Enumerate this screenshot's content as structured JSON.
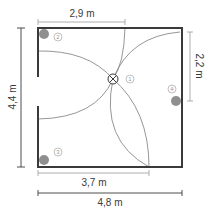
{
  "diagram": {
    "type": "floor-plan",
    "colors": {
      "wall": "#3a3a3a",
      "arc": "#8a8a8a",
      "dimension_line": "#9a9a9a",
      "dimension_text": "#3a3a3a",
      "device_dot": "#8f8f8f",
      "label_circle": "#b0b0b0"
    },
    "dimensions": {
      "top": "2,9 m",
      "right": "2,2 m",
      "left": "4,4 m",
      "bottom_inner": "3,7 m",
      "bottom_outer": "4,8 m"
    },
    "markers": [
      {
        "id": "1",
        "label": "1",
        "kind": "center-symbol"
      },
      {
        "id": "2",
        "label": "2",
        "kind": "corner-dot"
      },
      {
        "id": "3",
        "label": "3",
        "kind": "corner-dot"
      },
      {
        "id": "4",
        "label": "4",
        "kind": "wall-dot"
      }
    ]
  }
}
